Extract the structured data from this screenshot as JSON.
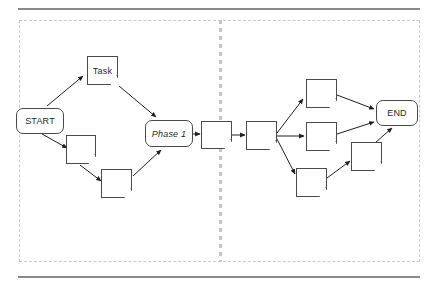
{
  "diagram": {
    "type": "flowchart",
    "title": "",
    "orientation": "left-to-right",
    "lanes": [
      {
        "id": "lane-left",
        "label": ""
      },
      {
        "id": "lane-right",
        "label": ""
      }
    ],
    "divider": {
      "style": "dashed",
      "orientation": "vertical",
      "color": "#c4c4c4"
    },
    "container": {
      "style": "dashed",
      "color": "#c9c9c9"
    },
    "rules": {
      "color": "#8a8a8a",
      "count": 2
    },
    "nodes": [
      {
        "id": "start",
        "label": "START",
        "shape": "rounded-rect",
        "lane": "lane-left",
        "x": 16,
        "y": 108,
        "w": 48,
        "h": 26,
        "italic": false
      },
      {
        "id": "task",
        "label": "Task",
        "shape": "document",
        "lane": "lane-left",
        "x": 87,
        "y": 56,
        "w": 31,
        "h": 29,
        "italic": false
      },
      {
        "id": "n1",
        "label": "",
        "shape": "document",
        "lane": "lane-left",
        "x": 66,
        "y": 135,
        "w": 30,
        "h": 29,
        "italic": false
      },
      {
        "id": "n2",
        "label": "",
        "shape": "document",
        "lane": "lane-left",
        "x": 101,
        "y": 169,
        "w": 31,
        "h": 29,
        "italic": false
      },
      {
        "id": "phase1",
        "label": "Phase 1",
        "shape": "rounded-rect",
        "lane": "lane-left",
        "x": 145,
        "y": 120,
        "w": 48,
        "h": 27,
        "italic": true
      },
      {
        "id": "n3",
        "label": "",
        "shape": "document",
        "lane": "lane-left",
        "x": 201,
        "y": 121,
        "w": 31,
        "h": 28,
        "italic": false
      },
      {
        "id": "hub",
        "label": "",
        "shape": "document",
        "lane": "lane-right",
        "x": 246,
        "y": 121,
        "w": 31,
        "h": 29,
        "italic": false
      },
      {
        "id": "b1",
        "label": "",
        "shape": "document",
        "lane": "lane-right",
        "x": 306,
        "y": 79,
        "w": 31,
        "h": 29,
        "italic": false
      },
      {
        "id": "b2",
        "label": "",
        "shape": "document",
        "lane": "lane-right",
        "x": 306,
        "y": 122,
        "w": 31,
        "h": 29,
        "italic": false
      },
      {
        "id": "b3",
        "label": "",
        "shape": "document",
        "lane": "lane-right",
        "x": 296,
        "y": 168,
        "w": 31,
        "h": 29,
        "italic": false
      },
      {
        "id": "b4",
        "label": "",
        "shape": "document",
        "lane": "lane-right",
        "x": 351,
        "y": 142,
        "w": 31,
        "h": 29,
        "italic": false
      },
      {
        "id": "end",
        "label": "END",
        "shape": "rounded-rect",
        "lane": "lane-right",
        "x": 376,
        "y": 100,
        "w": 42,
        "h": 26,
        "italic": false
      }
    ],
    "edges": [
      {
        "from": "start",
        "to": "task"
      },
      {
        "from": "task",
        "to": "phase1"
      },
      {
        "from": "start",
        "to": "n1"
      },
      {
        "from": "n1",
        "to": "n2"
      },
      {
        "from": "n2",
        "to": "phase1"
      },
      {
        "from": "phase1",
        "to": "n3"
      },
      {
        "from": "n3",
        "to": "hub"
      },
      {
        "from": "hub",
        "to": "b1"
      },
      {
        "from": "hub",
        "to": "b2"
      },
      {
        "from": "hub",
        "to": "b3"
      },
      {
        "from": "b1",
        "to": "end"
      },
      {
        "from": "b2",
        "to": "end"
      },
      {
        "from": "b3",
        "to": "b4"
      },
      {
        "from": "b4",
        "to": "end"
      }
    ]
  }
}
